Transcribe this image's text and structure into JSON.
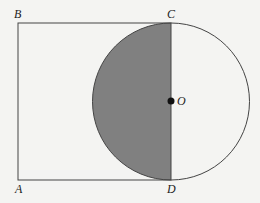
{
  "diagram": {
    "labels": {
      "A": "A",
      "B": "B",
      "C": "C",
      "D": "D",
      "O": "O"
    },
    "colors": {
      "background": "#f4f4f2",
      "stroke": "#444444",
      "shade": "#808080",
      "center_dot": "#111111"
    }
  }
}
